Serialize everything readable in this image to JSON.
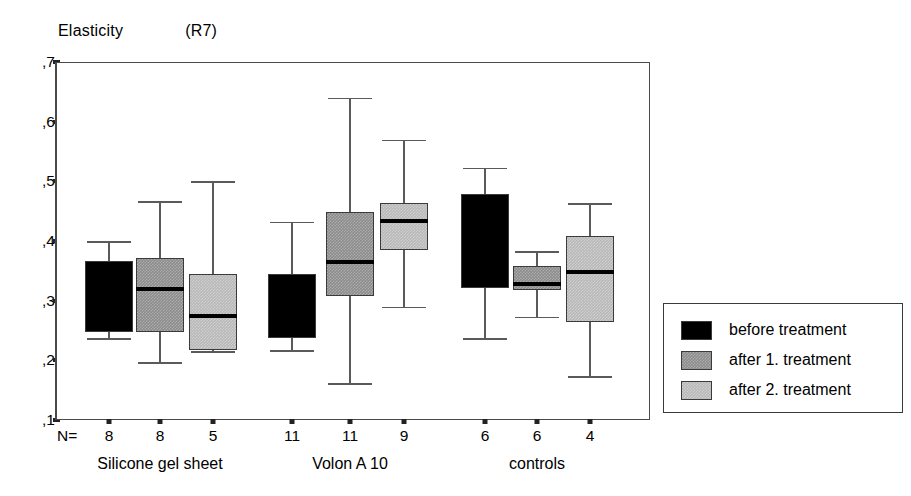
{
  "chart_data": {
    "type": "box",
    "title": "Elasticity",
    "title_units": "(R7)",
    "ylabel": "",
    "xlabel": "",
    "ylim": [
      0.1,
      0.7
    ],
    "ytick_labels": [
      ",7",
      ",6",
      ",5",
      ",4",
      ",3",
      ",2",
      ",1"
    ],
    "ytick_values": [
      0.7,
      0.6,
      0.5,
      0.4,
      0.3,
      0.2,
      0.1
    ],
    "grid": false,
    "legend_position": "right-outside",
    "n_prefix": "N=",
    "groups": [
      {
        "label": "Silicone gel sheet",
        "boxes": [
          {
            "series": "before treatment",
            "n": "8",
            "whisker_high": 0.4,
            "q3": 0.367,
            "median": 0.305,
            "q1": 0.248,
            "whisker_low": 0.237
          },
          {
            "series": "after 1. treatment",
            "n": "8",
            "whisker_high": 0.467,
            "q3": 0.372,
            "median": 0.32,
            "q1": 0.248,
            "whisker_low": 0.197
          },
          {
            "series": "after 2. treatment",
            "n": "5",
            "whisker_high": 0.5,
            "q3": 0.345,
            "median": 0.274,
            "q1": 0.218,
            "whisker_low": 0.215
          }
        ]
      },
      {
        "label": "Volon A 10",
        "boxes": [
          {
            "series": "before treatment",
            "n": "11",
            "whisker_high": 0.432,
            "q3": 0.345,
            "median": 0.29,
            "q1": 0.238,
            "whisker_low": 0.217
          },
          {
            "series": "after 1. treatment",
            "n": "11",
            "whisker_high": 0.64,
            "q3": 0.448,
            "median": 0.365,
            "q1": 0.307,
            "whisker_low": 0.162
          },
          {
            "series": "after 2. treatment",
            "n": "9",
            "whisker_high": 0.57,
            "q3": 0.463,
            "median": 0.433,
            "q1": 0.385,
            "whisker_low": 0.29
          }
        ]
      },
      {
        "label": "controls",
        "boxes": [
          {
            "series": "before treatment",
            "n": "6",
            "whisker_high": 0.523,
            "q3": 0.478,
            "median": 0.4,
            "q1": 0.322,
            "whisker_low": 0.237
          },
          {
            "series": "after 1. treatment",
            "n": "6",
            "whisker_high": 0.383,
            "q3": 0.358,
            "median": 0.328,
            "q1": 0.318,
            "whisker_low": 0.273
          },
          {
            "series": "after 2. treatment",
            "n": "4",
            "whisker_high": 0.463,
            "q3": 0.408,
            "median": 0.348,
            "q1": 0.265,
            "whisker_low": 0.173
          }
        ]
      }
    ],
    "legend": [
      {
        "label": "before  treatment",
        "color": "#000000",
        "style": "solid-black"
      },
      {
        "label": "after 1. treatment",
        "color": "#8c8c8c",
        "style": "hatch-mid"
      },
      {
        "label": "after 2. treatment",
        "color": "#b8b8b8",
        "style": "hatch-light"
      }
    ]
  }
}
